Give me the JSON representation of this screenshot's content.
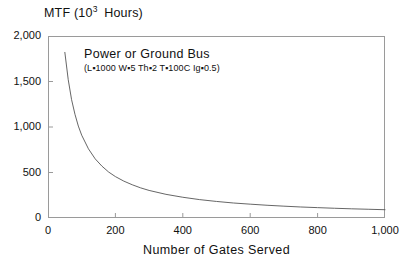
{
  "chart_data": {
    "type": "line",
    "title": "",
    "ylabel": "MTF (10^3 Hours)",
    "ylabel_parts": {
      "prefix": "MTF (10",
      "exponent": "3",
      "suffix": " Hours)"
    },
    "xlabel": "Number of Gates Served",
    "xlim": [
      0,
      1000
    ],
    "ylim": [
      0,
      2000
    ],
    "grid": false,
    "legend_position": "none",
    "xticks": [
      0,
      200,
      400,
      600,
      800,
      1000
    ],
    "xtick_labels": [
      "0",
      "200",
      "400",
      "600",
      "800",
      "1,000"
    ],
    "yticks": [
      0,
      500,
      1000,
      1500,
      2000
    ],
    "ytick_labels": [
      "0",
      "500",
      "1,000",
      "1,500",
      "2,000"
    ],
    "annotations": [
      {
        "name": "curve-label",
        "title": "Power or Ground Bus",
        "params": "(L▪1000 W▪5 Th▪2 T▪100C Ig▪0.5)"
      }
    ],
    "series": [
      {
        "name": "Power or Ground Bus MTF",
        "color": "#555555",
        "x": [
          50,
          60,
          70,
          80,
          90,
          100,
          120,
          140,
          160,
          180,
          200,
          225,
          250,
          275,
          300,
          350,
          400,
          450,
          500,
          550,
          600,
          650,
          700,
          750,
          800,
          850,
          900,
          950,
          1000
        ],
        "y": [
          1820,
          1520,
          1300,
          1140,
          1010,
          910,
          760,
          650,
          570,
          505,
          455,
          405,
          365,
          331,
          303,
          260,
          228,
          202,
          182,
          165,
          152,
          140,
          130,
          121,
          114,
          107,
          101,
          96,
          91
        ]
      }
    ]
  },
  "figure": {
    "background_color": "#ffffff",
    "frame_color": "#9a9a9a",
    "curve_color": "#555555"
  }
}
